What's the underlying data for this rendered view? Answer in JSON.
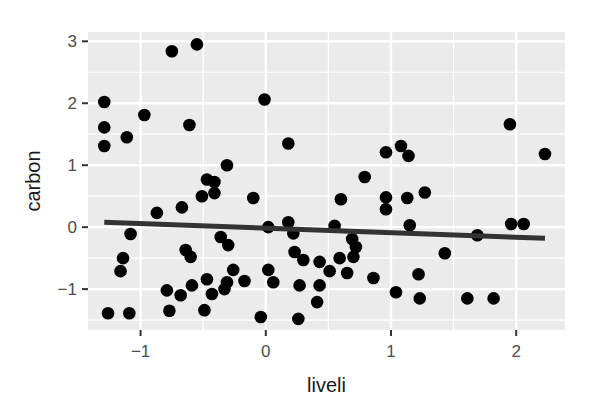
{
  "chart_data": {
    "type": "scatter",
    "title": "",
    "xlabel": "liveli",
    "ylabel": "carbon",
    "xlim": [
      -1.42,
      2.39
    ],
    "ylim": [
      -1.66,
      3.15
    ],
    "xticks": [
      -1,
      0,
      1,
      2
    ],
    "yticks": [
      -1,
      0,
      1,
      2,
      3
    ],
    "grid": true,
    "legend": null,
    "colors": {
      "panel_bg": "#ebebeb",
      "grid": "#ffffff",
      "point": "#000000",
      "line": "#333333"
    },
    "points": [
      [
        -1.29,
        2.02
      ],
      [
        -1.29,
        1.61
      ],
      [
        -1.29,
        1.31
      ],
      [
        -1.11,
        1.45
      ],
      [
        -0.97,
        1.81
      ],
      [
        -0.75,
        2.84
      ],
      [
        -0.55,
        2.95
      ],
      [
        -0.61,
        1.65
      ],
      [
        -0.01,
        2.06
      ],
      [
        0.18,
        1.35
      ],
      [
        -0.31,
        1.0
      ],
      [
        -0.47,
        0.77
      ],
      [
        -0.41,
        0.73
      ],
      [
        -0.51,
        0.5
      ],
      [
        -0.41,
        0.55
      ],
      [
        -0.1,
        0.47
      ],
      [
        -0.67,
        0.32
      ],
      [
        -0.87,
        0.23
      ],
      [
        -1.08,
        -0.11
      ],
      [
        -1.14,
        -0.5
      ],
      [
        -1.16,
        -0.71
      ],
      [
        -0.36,
        -0.16
      ],
      [
        -0.3,
        -0.29
      ],
      [
        -0.64,
        -0.37
      ],
      [
        -0.6,
        -0.48
      ],
      [
        -0.26,
        -0.69
      ],
      [
        -0.79,
        -1.02
      ],
      [
        -0.68,
        -1.1
      ],
      [
        -0.59,
        -0.94
      ],
      [
        -0.47,
        -0.84
      ],
      [
        -0.43,
        -1.08
      ],
      [
        -0.49,
        -1.34
      ],
      [
        -0.77,
        -1.35
      ],
      [
        -0.31,
        -0.89
      ],
      [
        -0.33,
        -1.0
      ],
      [
        -0.17,
        -0.87
      ],
      [
        -1.26,
        -1.39
      ],
      [
        -1.09,
        -1.39
      ],
      [
        -0.04,
        -1.45
      ],
      [
        0.02,
        0.0
      ],
      [
        0.18,
        0.08
      ],
      [
        0.22,
        -0.1
      ],
      [
        0.55,
        0.02
      ],
      [
        0.69,
        -0.19
      ],
      [
        0.72,
        -0.32
      ],
      [
        0.7,
        -0.48
      ],
      [
        0.23,
        -0.4
      ],
      [
        0.3,
        -0.53
      ],
      [
        0.43,
        -0.56
      ],
      [
        0.59,
        -0.5
      ],
      [
        0.51,
        -0.71
      ],
      [
        0.65,
        -0.74
      ],
      [
        0.86,
        -0.82
      ],
      [
        0.02,
        -0.69
      ],
      [
        0.06,
        -0.89
      ],
      [
        0.27,
        -0.94
      ],
      [
        0.43,
        -0.94
      ],
      [
        0.41,
        -1.21
      ],
      [
        0.26,
        -1.48
      ],
      [
        0.6,
        0.45
      ],
      [
        0.79,
        0.81
      ],
      [
        0.96,
        0.48
      ],
      [
        0.96,
        0.29
      ],
      [
        1.13,
        0.47
      ],
      [
        1.27,
        0.56
      ],
      [
        0.96,
        1.21
      ],
      [
        1.08,
        1.31
      ],
      [
        1.14,
        1.15
      ],
      [
        1.15,
        0.03
      ],
      [
        1.04,
        -1.05
      ],
      [
        1.22,
        -0.76
      ],
      [
        1.23,
        -1.15
      ],
      [
        1.43,
        -0.42
      ],
      [
        1.61,
        -1.15
      ],
      [
        1.69,
        -0.13
      ],
      [
        1.82,
        -1.15
      ],
      [
        1.95,
        1.66
      ],
      [
        1.96,
        0.05
      ],
      [
        2.06,
        0.05
      ],
      [
        2.23,
        1.18
      ]
    ],
    "regression_line": {
      "x": [
        -1.29,
        2.23
      ],
      "y": [
        0.08,
        -0.18
      ]
    }
  }
}
